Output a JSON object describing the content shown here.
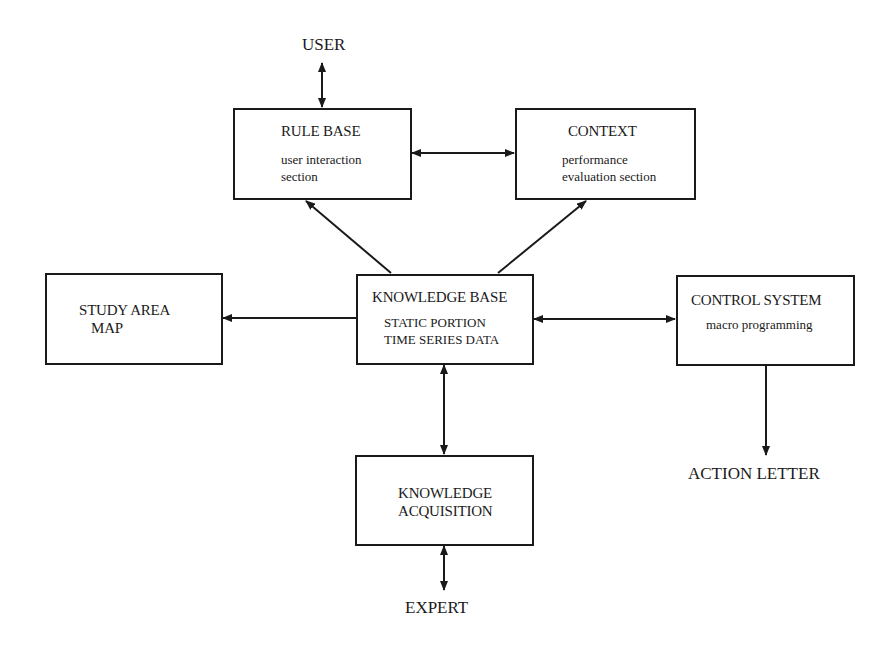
{
  "diagram": {
    "nodes": {
      "user": {
        "label": "USER"
      },
      "rule_base": {
        "title": "RULE BASE",
        "line1": "user interaction",
        "line2": "section"
      },
      "context": {
        "title": "CONTEXT",
        "line1": "performance",
        "line2": "evaluation section"
      },
      "study_area_map": {
        "line1": "STUDY AREA",
        "line2": "MAP"
      },
      "knowledge_base": {
        "title": "KNOWLEDGE BASE",
        "line1": "STATIC PORTION",
        "line2": "TIME SERIES DATA"
      },
      "control_system": {
        "title": "CONTROL SYSTEM",
        "line1": "macro programming"
      },
      "action_letter": {
        "label": "ACTION LETTER"
      },
      "knowledge_acquisition": {
        "line1": "KNOWLEDGE",
        "line2": "ACQUISITION"
      },
      "expert": {
        "label": "EXPERT"
      }
    },
    "edges": [
      {
        "from": "user",
        "to": "rule_base",
        "direction": "both"
      },
      {
        "from": "rule_base",
        "to": "context",
        "direction": "both"
      },
      {
        "from": "knowledge_base",
        "to": "rule_base",
        "direction": "forward"
      },
      {
        "from": "knowledge_base",
        "to": "context",
        "direction": "forward"
      },
      {
        "from": "knowledge_base",
        "to": "study_area_map",
        "direction": "forward"
      },
      {
        "from": "knowledge_base",
        "to": "control_system",
        "direction": "both"
      },
      {
        "from": "control_system",
        "to": "action_letter",
        "direction": "forward"
      },
      {
        "from": "knowledge_base",
        "to": "knowledge_acquisition",
        "direction": "both"
      },
      {
        "from": "knowledge_acquisition",
        "to": "expert",
        "direction": "both"
      }
    ],
    "line_color": "#1a1a1a"
  }
}
